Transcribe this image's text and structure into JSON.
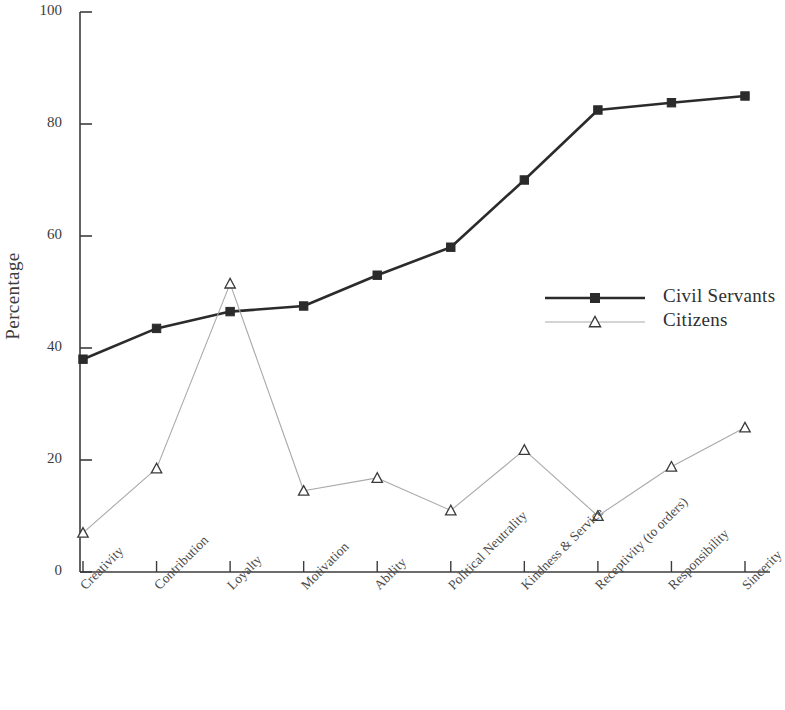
{
  "chart_data": {
    "type": "line",
    "title": "",
    "xlabel": "",
    "ylabel": "Percentage",
    "ylim": [
      0,
      100
    ],
    "yticks": [
      0,
      20,
      40,
      60,
      80,
      100
    ],
    "grid": false,
    "legend_position": "right-middle",
    "categories": [
      "Creativity",
      "Contribution",
      "Loyalty",
      "Motivation",
      "Ability",
      "Political Neutrality",
      "Kindness & Service",
      "Receptivity (to orders)",
      "Responsibility",
      "Sincerity"
    ],
    "series": [
      {
        "name": "Civil Servants",
        "color": "#2b2b2b",
        "marker": "square-filled",
        "values": [
          38,
          43.5,
          46.5,
          47.5,
          53,
          58,
          70,
          82.5,
          83.8,
          85
        ]
      },
      {
        "name": "Citizens",
        "color": "#a9a9a9",
        "marker": "triangle-open",
        "values": [
          7,
          18.5,
          51.5,
          14.5,
          16.8,
          11,
          21.8,
          10,
          18.8,
          25.8
        ]
      }
    ]
  },
  "axis": {
    "y_tick_labels": [
      "0",
      "20",
      "40",
      "60",
      "80",
      "100"
    ],
    "y_axis_title": "Percentage"
  },
  "legend": {
    "entries": [
      {
        "label": "Civil Servants"
      },
      {
        "label": "Citizens"
      }
    ]
  }
}
